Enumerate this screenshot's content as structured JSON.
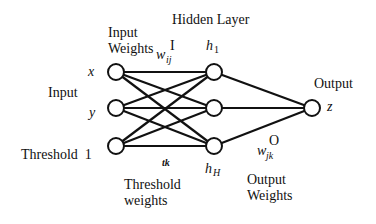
{
  "diagram": {
    "labels": {
      "hidden_layer": "Hidden Layer",
      "input_weights_line1": "Input",
      "input_weights_line2": "Weights",
      "input_weight_symbol": "w",
      "input_weight_sub": "ij",
      "input_weight_sup": "I",
      "input": "Input",
      "threshold": "Threshold  1",
      "threshold_weight_symbol": "tk",
      "threshold_weights_line1": "Threshold",
      "threshold_weights_line2": "weights",
      "output": "Output",
      "output_weight_symbol": "w",
      "output_weight_sub": "jk",
      "output_weight_sup": "O",
      "output_weights_line1": "Output",
      "output_weights_line2": "Weights"
    },
    "input_nodes": [
      {
        "id": "x",
        "label": "x"
      },
      {
        "id": "y",
        "label": "y"
      },
      {
        "id": "threshold",
        "label": "1"
      }
    ],
    "hidden_nodes": [
      {
        "id": "h1",
        "label": "h",
        "sub": "1"
      },
      {
        "id": "h2",
        "label": "",
        "sub": ""
      },
      {
        "id": "hH",
        "label": "h",
        "sub": "H"
      }
    ],
    "output_nodes": [
      {
        "id": "z",
        "label": "z"
      }
    ],
    "connections": "fully-connected"
  }
}
